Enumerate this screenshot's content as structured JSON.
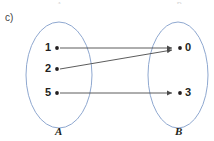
{
  "figure": {
    "part_label": "c)",
    "type": "mapping-diagram",
    "left_set": {
      "name": "A",
      "elements": [
        "1",
        "2",
        "5"
      ]
    },
    "right_set": {
      "name": "B",
      "elements": [
        "0",
        "3"
      ]
    },
    "mappings": [
      {
        "from": "1",
        "to": "0"
      },
      {
        "from": "2",
        "to": "0"
      },
      {
        "from": "5",
        "to": "3"
      }
    ],
    "colors": {
      "ellipse_stroke": "#8fa8d0",
      "arrow": "#4a4a4a",
      "text": "#231f20",
      "background": "#ffffff"
    },
    "top_cropped_labels": {
      "left": "A",
      "right": "B"
    }
  }
}
